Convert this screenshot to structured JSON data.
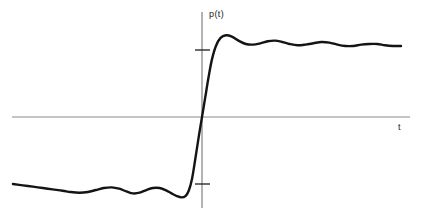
{
  "figure": {
    "background_color": "#ffffff",
    "curve_color": "#141414",
    "axis_color": "#8a8a8a",
    "label_color": "#1a1a1a"
  },
  "axes": {
    "y_axis_label": "p(t)",
    "x_axis_label": "t",
    "origin_px": {
      "x": 202,
      "y": 117
    },
    "x_axis_extent_px": {
      "x1": 12,
      "x2": 410
    },
    "y_axis_extent_px": {
      "y1": 12,
      "y2": 208
    },
    "ticks": [
      {
        "name": "upper-tick",
        "value": 1,
        "y_px": 50
      },
      {
        "name": "lower-tick",
        "value": -1,
        "y_px": 184
      }
    ]
  },
  "chart_data": {
    "type": "line",
    "title": "",
    "xlabel": "t",
    "ylabel": "p(t)",
    "grid": false,
    "legend": false,
    "xlim": [
      -2.9,
      3.1
    ],
    "ylim": [
      -1.45,
      1.45
    ],
    "series": [
      {
        "name": "p(t)",
        "color": "#141414",
        "points": [
          [
            -2.85,
            -1.0
          ],
          [
            -2.7,
            -1.02
          ],
          [
            -2.55,
            -1.04
          ],
          [
            -2.4,
            -1.06
          ],
          [
            -2.25,
            -1.08
          ],
          [
            -2.1,
            -1.1
          ],
          [
            -1.98,
            -1.12
          ],
          [
            -1.85,
            -1.13
          ],
          [
            -1.72,
            -1.12
          ],
          [
            -1.6,
            -1.09
          ],
          [
            -1.48,
            -1.06
          ],
          [
            -1.36,
            -1.05
          ],
          [
            -1.25,
            -1.07
          ],
          [
            -1.14,
            -1.11
          ],
          [
            -1.04,
            -1.14
          ],
          [
            -0.94,
            -1.13
          ],
          [
            -0.84,
            -1.09
          ],
          [
            -0.74,
            -1.06
          ],
          [
            -0.64,
            -1.06
          ],
          [
            -0.55,
            -1.09
          ],
          [
            -0.46,
            -1.14
          ],
          [
            -0.38,
            -1.18
          ],
          [
            -0.31,
            -1.2
          ],
          [
            -0.25,
            -1.18
          ],
          [
            -0.2,
            -1.1
          ],
          [
            -0.15,
            -0.92
          ],
          [
            -0.1,
            -0.62
          ],
          [
            -0.05,
            -0.3
          ],
          [
            0.0,
            0.0
          ],
          [
            0.05,
            0.3
          ],
          [
            0.1,
            0.6
          ],
          [
            0.15,
            0.86
          ],
          [
            0.21,
            1.06
          ],
          [
            0.28,
            1.18
          ],
          [
            0.36,
            1.22
          ],
          [
            0.45,
            1.2
          ],
          [
            0.55,
            1.14
          ],
          [
            0.66,
            1.09
          ],
          [
            0.77,
            1.08
          ],
          [
            0.88,
            1.1
          ],
          [
            0.99,
            1.13
          ],
          [
            1.1,
            1.14
          ],
          [
            1.21,
            1.12
          ],
          [
            1.32,
            1.09
          ],
          [
            1.44,
            1.07
          ],
          [
            1.56,
            1.08
          ],
          [
            1.68,
            1.1
          ],
          [
            1.8,
            1.12
          ],
          [
            1.92,
            1.11
          ],
          [
            2.04,
            1.08
          ],
          [
            2.16,
            1.06
          ],
          [
            2.28,
            1.06
          ],
          [
            2.4,
            1.08
          ],
          [
            2.52,
            1.09
          ],
          [
            2.64,
            1.09
          ],
          [
            2.76,
            1.07
          ],
          [
            2.88,
            1.06
          ],
          [
            3.0,
            1.06
          ]
        ]
      }
    ]
  }
}
